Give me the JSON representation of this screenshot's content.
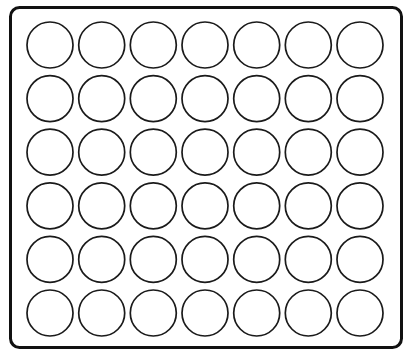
{
  "canvas": {
    "width": 414,
    "height": 363,
    "background_color": "#ffffff"
  },
  "figure": {
    "style": "black-and-white line drawing, no fill, no labels"
  },
  "tray": {
    "name": "tray-outline",
    "shape": "rounded-rectangle",
    "x": 10.5,
    "y": 7.5,
    "width": 391,
    "height": 340,
    "corner_radius": 9,
    "stroke_color": "#111111",
    "stroke_width": 3,
    "fill_color": "#ffffff"
  },
  "grid": {
    "name": "circle-grid",
    "columns": 7,
    "rows": 6,
    "total_circles": 42,
    "circle_diameter": 46,
    "circle_radius": 23,
    "column_pitch": 51.7,
    "row_pitch": 53.6,
    "first_center_x": 50,
    "first_center_y": 45,
    "stroke_color": "#1a1a1a",
    "stroke_width": 1.7,
    "fill_color": "#ffffff",
    "column_centers_x": [
      50,
      101.7,
      153.3,
      205,
      256.7,
      308.3,
      360
    ],
    "row_centers_y": [
      45,
      98.6,
      152.2,
      205.8,
      259.4,
      313
    ]
  }
}
